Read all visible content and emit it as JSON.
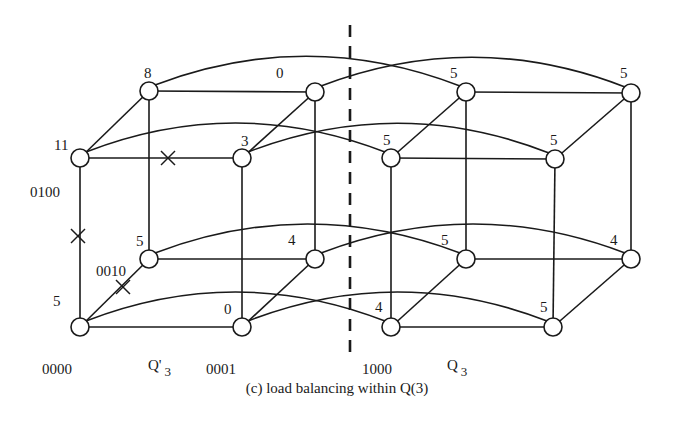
{
  "caption": "(c) load balancing within Q(3)",
  "divider": {
    "x": 350,
    "y1": 25,
    "y2": 358
  },
  "cubes": [
    {
      "name": "Q'3",
      "label_main": "Q'",
      "label_sub": "3",
      "label_pos": [
        148,
        358
      ],
      "nodes": {
        "tbl": [
          149,
          91
        ],
        "tbr": [
          315,
          92
        ],
        "tfl": [
          80,
          158
        ],
        "tfr": [
          242,
          158
        ],
        "bbl": [
          149,
          259
        ],
        "bbr": [
          315,
          259
        ],
        "bfl": [
          80,
          327
        ],
        "bfr": [
          242,
          327
        ]
      },
      "loads": {
        "tbl": {
          "value": "8",
          "pos": [
            144,
            66
          ]
        },
        "tbr": {
          "value": "0",
          "pos": [
            276,
            66
          ]
        },
        "tfl": {
          "value": "11",
          "pos": [
            54,
            138
          ]
        },
        "tfr": {
          "value": "3",
          "pos": [
            241,
            134
          ]
        },
        "bbl": {
          "value": "5",
          "pos": [
            136,
            234
          ]
        },
        "bbr": {
          "value": "4",
          "pos": [
            288,
            233
          ]
        },
        "bfl": {
          "value": "5",
          "pos": [
            53,
            294
          ]
        },
        "bfr": {
          "value": "0",
          "pos": [
            224,
            302
          ]
        }
      },
      "addresses": {
        "tfl": {
          "value": "0100",
          "pos": [
            30,
            185
          ]
        },
        "bbl": {
          "value": "0010",
          "pos": [
            96,
            264
          ]
        },
        "bfl": {
          "value": "0000",
          "pos": [
            42,
            362
          ]
        },
        "bfr": {
          "value": "0001",
          "pos": [
            206,
            362
          ]
        }
      }
    },
    {
      "name": "Q3",
      "label_main": "Q",
      "label_sub": "3",
      "label_pos": [
        447,
        358
      ],
      "nodes": {
        "tbl": [
          466,
          92
        ],
        "tbr": [
          631,
          93
        ],
        "tfl": [
          391,
          158
        ],
        "tfr": [
          555,
          159
        ],
        "bbl": [
          466,
          259
        ],
        "bbr": [
          631,
          259
        ],
        "bfl": [
          391,
          327
        ],
        "bfr": [
          553,
          327
        ]
      },
      "loads": {
        "tbl": {
          "value": "5",
          "pos": [
            450,
            66
          ]
        },
        "tbr": {
          "value": "5",
          "pos": [
            620,
            66
          ]
        },
        "tfl": {
          "value": "5",
          "pos": [
            383,
            133
          ]
        },
        "tfr": {
          "value": "5",
          "pos": [
            550,
            133
          ]
        },
        "bbl": {
          "value": "5",
          "pos": [
            441,
            233
          ]
        },
        "bbr": {
          "value": "4",
          "pos": [
            610,
            233
          ]
        },
        "bfl": {
          "value": "4",
          "pos": [
            375,
            300
          ]
        },
        "bfr": {
          "value": "5",
          "pos": [
            540,
            300
          ]
        }
      },
      "addresses": {
        "bfl": {
          "value": "1000",
          "pos": [
            362,
            362
          ]
        }
      }
    }
  ],
  "crossed_edges": [
    {
      "name": "cross-0100-0101",
      "pos": [
        168,
        158
      ]
    },
    {
      "name": "cross-0000-0100",
      "pos": [
        78,
        236
      ]
    },
    {
      "name": "cross-0000-0010",
      "pos": [
        123,
        287
      ]
    }
  ]
}
